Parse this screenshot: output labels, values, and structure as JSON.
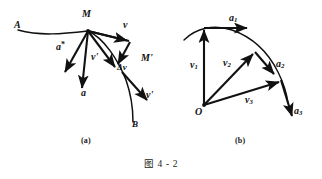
{
  "figure": {
    "caption": "图 4 - 2",
    "panels": [
      {
        "id": "a",
        "caption": "(a)"
      },
      {
        "id": "b",
        "caption": "(b)"
      }
    ]
  },
  "panel_a": {
    "labels": {
      "point_a": "A",
      "point_b": "B",
      "point_m": "M",
      "point_m_prime": "M'",
      "vector_v": "v",
      "vector_v_prime_moved": "v'",
      "vector_v_prime_curve": "v'",
      "vector_delta_v": "Δv",
      "vector_a_star": "a",
      "vector_a_star_sup": "*",
      "vector_a": "a"
    },
    "description": "Curved trajectory from A to B with point M and M', velocity vectors v and v', the velocity change delta-v, average acceleration a* and instantaneous acceleration a"
  },
  "panel_b": {
    "labels": {
      "origin": "O",
      "vector_v1": "v",
      "vector_v1_sub": "1",
      "vector_v2": "v",
      "vector_v2_sub": "2",
      "vector_v3": "v",
      "vector_v3_sub": "3",
      "vector_a1": "a",
      "vector_a1_sub": "1",
      "vector_a2": "a",
      "vector_a2_sub": "2",
      "vector_a3": "a",
      "vector_a3_sub": "3"
    },
    "description": "Hodograph: velocity vectors v1, v2, v3 drawn from common origin O with corresponding acceleration vectors a1, a2, a3 tangent to the hodograph curve"
  },
  "colors": {
    "ink": "#111111",
    "background": "#ffffff"
  }
}
